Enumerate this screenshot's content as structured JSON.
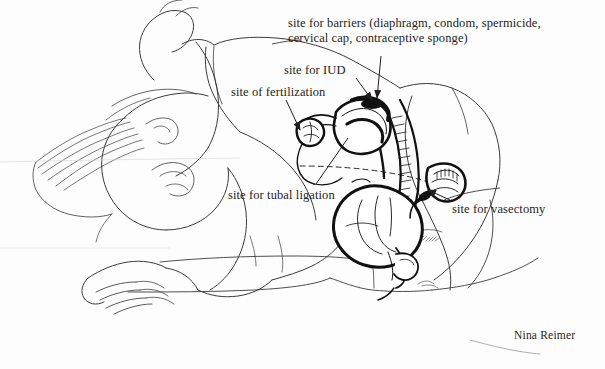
{
  "illustration": {
    "title": "Sites of contraception in an embracing couple (cross-section)",
    "background_color": "#fdfdfd",
    "ink_color": "#231f20",
    "line_color": "#3a3a3a",
    "artist_signature": "Nina Reimer"
  },
  "labels": {
    "barriers": "site for barriers (diaphragm, condom, spermicide, cervical cap, contraceptive sponge)",
    "barriers_line1": "site for barriers (diaphragm, condom, spermicide,",
    "barriers_line2": "cervical cap, contraceptive sponge)",
    "iud": "site for IUD",
    "fertilization": "site of fertilization",
    "tubal_ligation": "site for tubal ligation",
    "vasectomy": "site for vasectomy"
  },
  "annotations": [
    {
      "name": "barriers",
      "text": "site for barriers (diaphragm, condom, spermicide, cervical cap, contraceptive sponge)",
      "target": "cervix / vaginal canal",
      "leader": "vertical line with arrowhead pointing down to cervix"
    },
    {
      "name": "iud",
      "text": "site for IUD",
      "target": "uterine cavity",
      "leader": "diagonal line with arrowhead pointing down-right into uterus"
    },
    {
      "name": "fertilization",
      "text": "site of fertilization",
      "target": "fallopian tube / ampulla near ovary",
      "leader": "diagonal line with arrowhead pointing down-right to ovary"
    },
    {
      "name": "tubal-ligation",
      "text": "site for tubal ligation",
      "target": "fallopian tube",
      "leader": "diagonal line running up-right to the fallopian tube"
    },
    {
      "name": "vasectomy",
      "text": "site for vasectomy",
      "target": "vas deferens",
      "leader": "diagonal line with arrowhead pointing up-left to vas deferens"
    }
  ]
}
